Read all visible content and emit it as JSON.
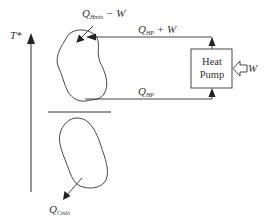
{
  "diagram": {
    "axis": {
      "label": "T*"
    },
    "labels": {
      "q_hmin_minus_w": {
        "main": "Q",
        "sub": "Hmin",
        "rest": " − W"
      },
      "q_hp_plus_w": {
        "main": "Q",
        "sub": "HP",
        "rest": " + W"
      },
      "q_hp": {
        "main": "Q",
        "sub": "HP",
        "rest": ""
      },
      "q_cmin": {
        "main": "Q",
        "sub": "Cmin",
        "rest": ""
      },
      "w_input": "W"
    },
    "heat_pump": {
      "line1": "Heat",
      "line2": "Pump"
    },
    "colors": {
      "stroke": "#333333",
      "background": "#ffffff"
    }
  }
}
